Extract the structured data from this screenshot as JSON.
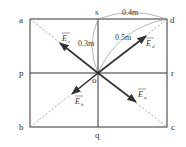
{
  "figure": {
    "corner_labels": {
      "a": "a",
      "b": "b",
      "c": "c",
      "d": "d"
    },
    "midpoint_labels": {
      "p": "p",
      "q": "q",
      "r": "r",
      "s": "s"
    },
    "center_label": "o",
    "dimensions": {
      "sd": "0.4m",
      "os": "0.3m",
      "od": "0.5m"
    },
    "vectors": [
      {
        "id": "Ec",
        "symbol": "E",
        "subscript": "c",
        "direction": "toward-a"
      },
      {
        "id": "Ed",
        "symbol": "E",
        "subscript": "d",
        "direction": "toward-d"
      },
      {
        "id": "Eb",
        "symbol": "E",
        "subscript": "b",
        "direction": "toward-b"
      },
      {
        "id": "Ea",
        "symbol": "E",
        "subscript": "a",
        "direction": "toward-c"
      }
    ],
    "colors": {
      "line": "#333333",
      "dashed": "#888888",
      "arc": "#999999"
    }
  }
}
